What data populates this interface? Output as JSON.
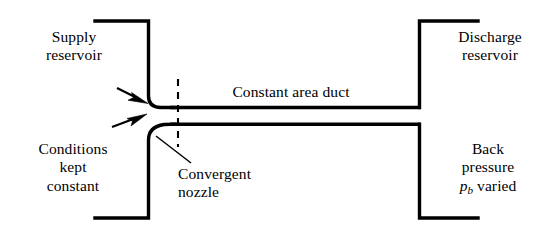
{
  "figure": {
    "width": 548,
    "height": 234,
    "background_color": "#ffffff",
    "line_color": "#000000"
  },
  "labels": {
    "supply_reservoir": {
      "line1": "Supply",
      "line2": "reservoir"
    },
    "conditions_constant": {
      "line1": "Conditions",
      "line2": "kept",
      "line3": "constant"
    },
    "constant_area_duct": {
      "text": "Constant area duct"
    },
    "convergent_nozzle": {
      "line1": "Convergent",
      "line2": "nozzle"
    },
    "discharge_reservoir": {
      "line1": "Discharge",
      "line2": "reservoir"
    },
    "back_pressure": {
      "line1": "Back",
      "line2": "pressure",
      "symbol": "p",
      "subscript": "b",
      "line3_tail": " varied"
    }
  },
  "annotations": {
    "inlet_flow_arrows": 2,
    "throat_station_line_style": "dashed",
    "nozzle_leader_line": "callout"
  }
}
